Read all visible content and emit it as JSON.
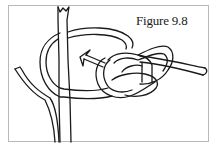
{
  "figure": {
    "caption": "Figure 9.8",
    "elements": [
      "post",
      "branch",
      "rope-loop",
      "figure-eight-knot",
      "rope-tail",
      "direction-arrow"
    ],
    "colors": {
      "line": "#1a1a1a",
      "background": "#ffffff",
      "frame": "#b8b8b8"
    }
  }
}
